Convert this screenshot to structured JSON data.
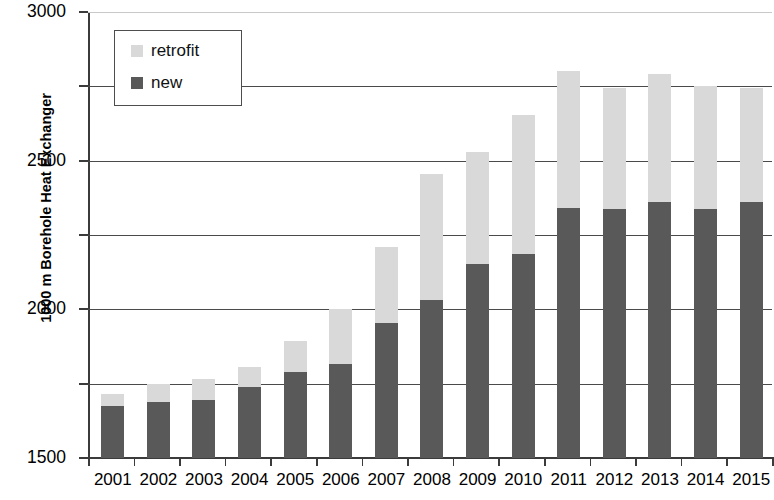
{
  "chart_data": {
    "type": "bar",
    "stacked": true,
    "title": "",
    "xlabel": "",
    "ylabel": "1000 m Borehole Heat Exchanger",
    "ylim": [
      0,
      3000
    ],
    "ytick_values": [
      0,
      500,
      1000,
      1500,
      2000,
      2500,
      3000
    ],
    "ytick_labels": [
      "0",
      "500",
      "1000",
      "1500",
      "2000",
      "2500",
      "3000"
    ],
    "grid": true,
    "legend_position": "top-left",
    "categories": [
      "2001",
      "2002",
      "2003",
      "2004",
      "2005",
      "2006",
      "2007",
      "2008",
      "2009",
      "2010",
      "2011",
      "2012",
      "2013",
      "2014",
      "2015"
    ],
    "series": [
      {
        "name": "new",
        "color": "#595959",
        "values": [
          350,
          375,
          390,
          475,
          580,
          635,
          905,
          1060,
          1305,
          1375,
          1680,
          1675,
          1725,
          1675,
          1725
        ]
      },
      {
        "name": "retrofit",
        "color": "#d9d9d9",
        "values": [
          80,
          120,
          140,
          140,
          210,
          365,
          515,
          850,
          755,
          935,
          920,
          815,
          855,
          825,
          765
        ]
      }
    ],
    "totals": [
      430,
      495,
      530,
      615,
      790,
      1000,
      1420,
      1910,
      2060,
      2310,
      2600,
      2490,
      2580,
      2500,
      2490
    ]
  },
  "legend": {
    "items": [
      {
        "label": "retrofit",
        "color": "#d9d9d9"
      },
      {
        "label": "new",
        "color": "#595959"
      }
    ]
  }
}
